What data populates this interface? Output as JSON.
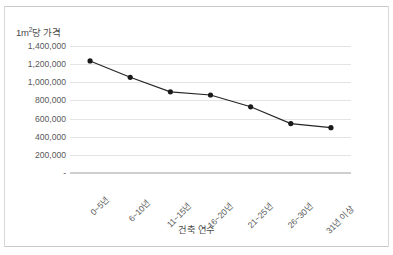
{
  "chart_data": {
    "type": "line",
    "title_parts": {
      "prefix": "1m",
      "sup": "2",
      "suffix": "당 가격"
    },
    "xlabel": "건축 연수",
    "ylabel": "1m²당 가격",
    "categories": [
      "0~5년",
      "6~10년",
      "11~15년",
      "16~20년",
      "21~25년",
      "26~30년",
      "31년 이상"
    ],
    "values": [
      1235000,
      1055000,
      895000,
      860000,
      730000,
      545000,
      500000
    ],
    "series": [
      {
        "name": "1m²당 가격",
        "values": [
          1235000,
          1055000,
          895000,
          860000,
          730000,
          545000,
          500000
        ]
      }
    ],
    "ylim": [
      0,
      1400000
    ],
    "ytick_values": [
      1400000,
      1200000,
      1000000,
      800000,
      600000,
      400000,
      200000,
      0
    ],
    "ytick_labels": [
      "1,400,000",
      "1,200,000",
      "1,000,000",
      "800,000",
      "600,000",
      "400,000",
      "200,000",
      "-"
    ],
    "grid": true,
    "legend": false,
    "legend_position": "none",
    "marker": "circle",
    "line_color": "#262626",
    "marker_color": "#1a1a1a",
    "grid_color": "#e4e4e4",
    "axis_color": "#cfcfcf",
    "text_color": "#595959",
    "background": "#ffffff",
    "xtick_rotation": -45
  }
}
